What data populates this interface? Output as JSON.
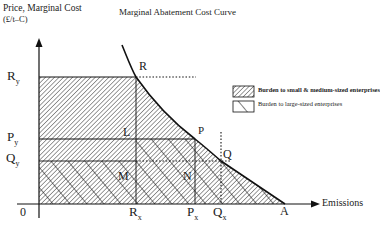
{
  "title": {
    "ylabel_line1": "Price, Marginal Cost",
    "ylabel_line2": "(£/t–C)",
    "curve_label": "Marginal Abatement Cost Curve",
    "xlabel": "Emissions"
  },
  "axis_labels": {
    "origin": "0",
    "Ry": "R",
    "Ry_sub": "y",
    "Py": "P",
    "Py_sub": "y",
    "Qy": "Q",
    "Qy_sub": "y",
    "Rx": "R",
    "Rx_sub": "x",
    "Px": "P",
    "Px_sub": "x",
    "Qx": "Q",
    "Qx_sub": "x",
    "A": "A"
  },
  "points": {
    "R": "R",
    "P": "P",
    "Q": "Q",
    "L": "L",
    "M": "M",
    "N": "N"
  },
  "legend": {
    "items": [
      {
        "label": "Burden to small & medium-sized enterprises",
        "pattern": "fine-forward-hatch",
        "bold": true
      },
      {
        "label": "Burden  to large-sized enterprises",
        "pattern": "coarse-back-hatch",
        "bold": false
      }
    ]
  },
  "colors": {
    "ink": "#111111",
    "background": "#ffffff"
  }
}
